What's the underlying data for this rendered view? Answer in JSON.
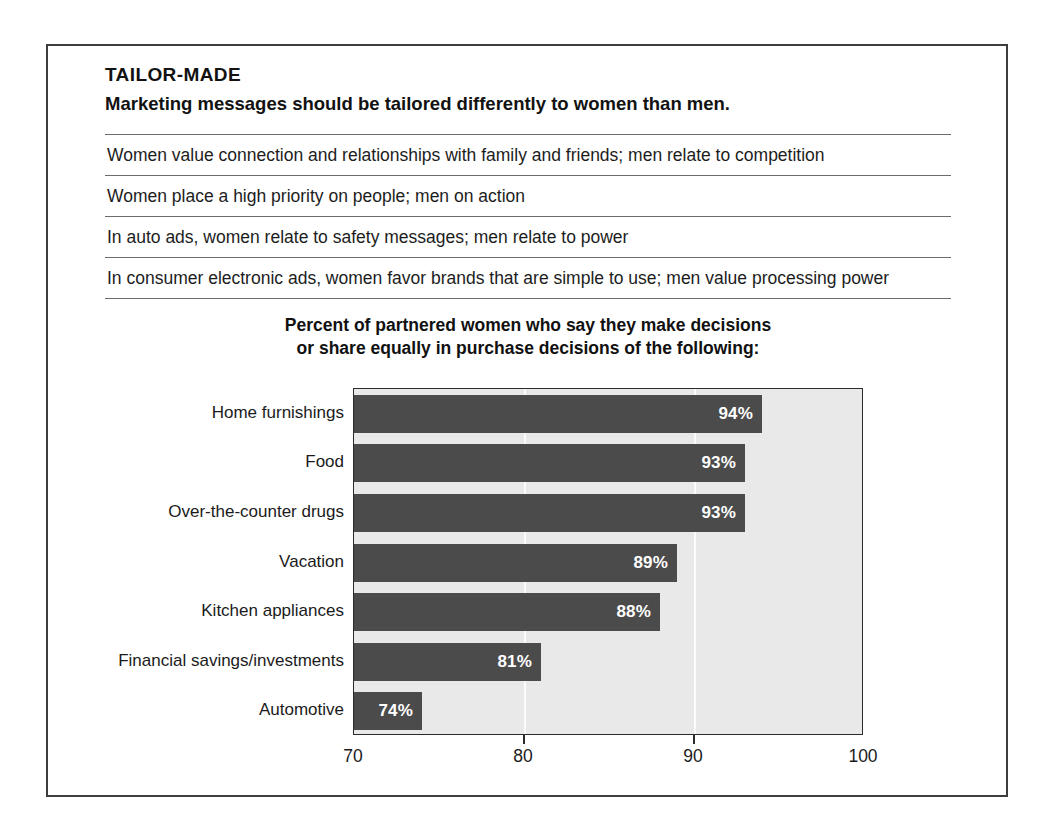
{
  "header": {
    "kicker": "TAILOR-MADE",
    "subhead": "Marketing messages should be tailored differently to women than men."
  },
  "facts": [
    "Women value connection and relationships with family and friends; men relate to competition",
    "Women place a high priority on people; men on action",
    "In auto ads, women relate to safety messages; men relate to power",
    "In consumer electronic ads, women favor brands that are simple to use; men value processing power"
  ],
  "chart_title": {
    "line1": "Percent of partnered women who say they make decisions",
    "line2": "or share equally in purchase decisions of the following:"
  },
  "colors": {
    "bar": "#4b4b4b",
    "plot_background": "#e9e9e9",
    "gridline": "#fbfbfb",
    "frame": "#3d3d3d",
    "rule": "#6b6b6b",
    "value_text": "#ffffff"
  },
  "chart_data": {
    "type": "bar",
    "orientation": "horizontal",
    "title": "Percent of partnered women who say they make decisions or share equally in purchase decisions of the following:",
    "xlabel": "",
    "ylabel": "",
    "xlim": [
      70,
      100
    ],
    "xticks": [
      70,
      80,
      90,
      100
    ],
    "xtick_labels": [
      "70",
      "80",
      "90",
      "100"
    ],
    "grid": true,
    "legend": "none",
    "value_suffix": "%",
    "categories": [
      "Home furnishings",
      "Food",
      "Over-the-counter drugs",
      "Vacation",
      "Kitchen appliances",
      "Financial savings/investments",
      "Automotive"
    ],
    "values": [
      94,
      93,
      93,
      89,
      88,
      81,
      74
    ],
    "value_labels": [
      "94%",
      "93%",
      "93%",
      "89%",
      "88%",
      "81%",
      "74%"
    ]
  }
}
